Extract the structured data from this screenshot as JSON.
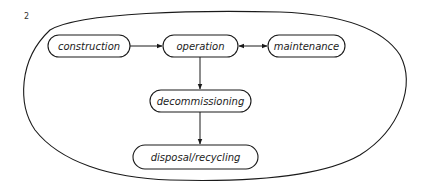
{
  "figure": {
    "number": "2"
  },
  "nodes": {
    "construction": "construction",
    "operation": "operation",
    "maintenance": "maintenance",
    "decommissioning": "decommissioning",
    "disposal": "disposal/recycling"
  },
  "edges": [
    {
      "from": "construction",
      "to": "operation",
      "type": "directed"
    },
    {
      "from": "operation",
      "to": "maintenance",
      "type": "bidirectional"
    },
    {
      "from": "operation",
      "to": "decommissioning",
      "type": "directed"
    },
    {
      "from": "decommissioning",
      "to": "disposal",
      "type": "directed"
    }
  ],
  "colors": {
    "stroke": "#1a1a1a",
    "background": "#ffffff"
  }
}
